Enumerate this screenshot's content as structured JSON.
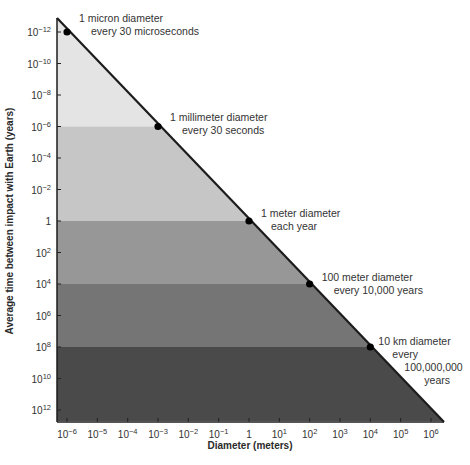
{
  "chart_data": {
    "type": "line",
    "title": "",
    "xlabel": "Diameter (meters)",
    "ylabel": "Average time between impact with Earth (years)",
    "xscale": "log",
    "yscale": "log",
    "xlim_exp": [
      -6,
      6
    ],
    "ylim_exp": [
      -12,
      12
    ],
    "x_ticks": [
      {
        "exp": -6,
        "base": "10",
        "sup": "−6"
      },
      {
        "exp": -5,
        "base": "10",
        "sup": "−5"
      },
      {
        "exp": -4,
        "base": "10",
        "sup": "−4"
      },
      {
        "exp": -3,
        "base": "10",
        "sup": "−3"
      },
      {
        "exp": -2,
        "base": "10",
        "sup": "−2"
      },
      {
        "exp": -1,
        "base": "10",
        "sup": "−1"
      },
      {
        "exp": 0,
        "base": "1",
        "sup": ""
      },
      {
        "exp": 1,
        "base": "10",
        "sup": "1"
      },
      {
        "exp": 2,
        "base": "10",
        "sup": "2"
      },
      {
        "exp": 3,
        "base": "10",
        "sup": "3"
      },
      {
        "exp": 4,
        "base": "10",
        "sup": "4"
      },
      {
        "exp": 5,
        "base": "10",
        "sup": "5"
      },
      {
        "exp": 6,
        "base": "10",
        "sup": "6"
      }
    ],
    "y_ticks": [
      {
        "exp": -12,
        "base": "10",
        "sup": "−12"
      },
      {
        "exp": -10,
        "base": "10",
        "sup": "−10"
      },
      {
        "exp": -8,
        "base": "10",
        "sup": "−8"
      },
      {
        "exp": -6,
        "base": "10",
        "sup": "−6"
      },
      {
        "exp": -4,
        "base": "10",
        "sup": "−4"
      },
      {
        "exp": -2,
        "base": "10",
        "sup": "−2"
      },
      {
        "exp": 0,
        "base": "1",
        "sup": ""
      },
      {
        "exp": 2,
        "base": "10",
        "sup": "2"
      },
      {
        "exp": 4,
        "base": "10",
        "sup": "4"
      },
      {
        "exp": 6,
        "base": "10",
        "sup": "6"
      },
      {
        "exp": 8,
        "base": "10",
        "sup": "8"
      },
      {
        "exp": 10,
        "base": "10",
        "sup": "10"
      },
      {
        "exp": 12,
        "base": "10",
        "sup": "12"
      }
    ],
    "series": [
      {
        "name": "impact frequency",
        "x_exp": [
          -6,
          -3,
          0,
          2,
          4
        ],
        "y_exp": [
          -12,
          -6,
          0,
          4,
          8
        ],
        "points": [
          {
            "diameter_m": 1e-06,
            "interval_years": 1e-12,
            "label_lines": [
              "1 micron diameter",
              "every 30 microseconds"
            ]
          },
          {
            "diameter_m": 0.001,
            "interval_years": 1e-06,
            "label_lines": [
              "1 millimeter diameter",
              "every 30 seconds"
            ]
          },
          {
            "diameter_m": 1,
            "interval_years": 1,
            "label_lines": [
              "1 meter diameter",
              "each year"
            ]
          },
          {
            "diameter_m": 100,
            "interval_years": 10000.0,
            "label_lines": [
              "100 meter diameter",
              "every 10,000 years"
            ]
          },
          {
            "diameter_m": 10000.0,
            "interval_years": 100000000.0,
            "label_lines": [
              "10 km diameter",
              "every",
              "100,000,000",
              "years"
            ]
          }
        ]
      }
    ],
    "bands": [
      {
        "from_exp": -13,
        "to_exp": -6,
        "color": "#e4e4e4"
      },
      {
        "from_exp": -6,
        "to_exp": 0,
        "color": "#c6c6c6"
      },
      {
        "from_exp": 0,
        "to_exp": 4,
        "color": "#979797"
      },
      {
        "from_exp": 4,
        "to_exp": 8,
        "color": "#757575"
      },
      {
        "from_exp": 8,
        "to_exp": 12.7,
        "color": "#4a4a4a"
      }
    ],
    "grid": false,
    "legend": null
  }
}
